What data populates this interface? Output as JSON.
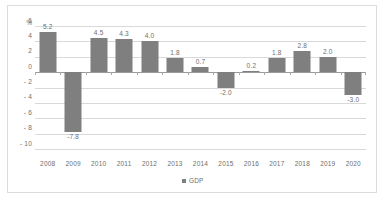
{
  "chart_data": {
    "type": "bar",
    "title": "",
    "xlabel": "",
    "ylabel": "%",
    "categories": [
      "2008",
      "2009",
      "2010",
      "2011",
      "2012",
      "2013",
      "2014",
      "2015",
      "2016",
      "2017",
      "2018",
      "2019",
      "2020"
    ],
    "values": [
      5.2,
      -7.8,
      4.5,
      4.3,
      4.0,
      1.8,
      0.7,
      -2.0,
      0.2,
      1.8,
      2.8,
      2.0,
      -3.0
    ],
    "data_labels": [
      "5.2",
      "-7.8",
      "4.5",
      "4.3",
      "4.0",
      "1.8",
      "0.7",
      "-2.0",
      "0.2",
      "1.8",
      "2.8",
      "2.0",
      "-3.0"
    ],
    "series": [
      {
        "name": "GDP",
        "color": "#7f7f7f",
        "values": [
          5.2,
          -7.8,
          4.5,
          4.3,
          4.0,
          1.8,
          0.7,
          -2.0,
          0.2,
          1.8,
          2.8,
          2.0,
          -3.0
        ]
      }
    ],
    "ylim": [
      -10,
      6
    ],
    "ytick_values": [
      6,
      4,
      2,
      0,
      -2,
      -4,
      -6,
      -8,
      -10
    ],
    "ytick_labels": [
      "6",
      "4",
      "2",
      "0",
      "- 2",
      "- 4",
      "- 6",
      "- 8",
      "- 10"
    ],
    "grid": true,
    "legend": {
      "position": "bottom",
      "entries": [
        "GDP"
      ]
    }
  },
  "legend": {
    "gdp_label": "GDP"
  },
  "axis": {
    "unit_label": "%"
  }
}
